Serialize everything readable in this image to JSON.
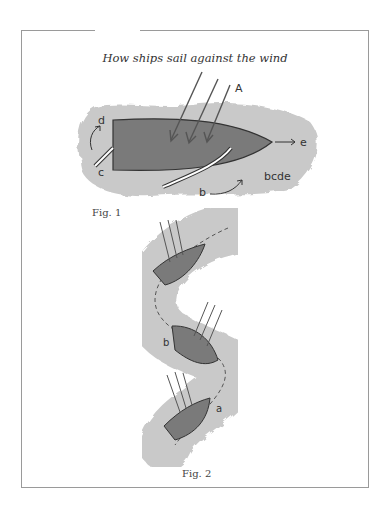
{
  "title": "How ships sail against the wind",
  "fig1": {
    "caption": "Fig. 1",
    "labels": {
      "A": "A",
      "b": "b",
      "c": "c",
      "d": "d",
      "e": "e",
      "note": "bcde"
    }
  },
  "fig2": {
    "caption": "Fig. 2",
    "labels": {
      "a": "a",
      "b": "b"
    }
  },
  "colors": {
    "water": "#c9c9c9",
    "hull": "#7a7a7a",
    "line": "#333333"
  }
}
